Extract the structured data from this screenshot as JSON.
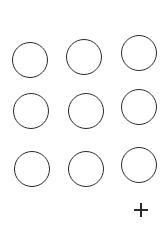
{
  "grid": {
    "stroke_color": "#2a2a2a",
    "circles": [
      {
        "cx": 30,
        "cy": 60,
        "r": 18
      },
      {
        "cx": 84,
        "cy": 57,
        "r": 18
      },
      {
        "cx": 139,
        "cy": 53,
        "r": 18
      },
      {
        "cx": 31,
        "cy": 111,
        "r": 18
      },
      {
        "cx": 86,
        "cy": 111,
        "r": 18
      },
      {
        "cx": 139,
        "cy": 107,
        "r": 18
      },
      {
        "cx": 32,
        "cy": 169,
        "r": 18
      },
      {
        "cx": 86,
        "cy": 169,
        "r": 18
      },
      {
        "cx": 139,
        "cy": 165,
        "r": 18
      }
    ]
  },
  "add_button": {
    "icon": "plus-icon",
    "cx": 141,
    "cy": 210
  }
}
